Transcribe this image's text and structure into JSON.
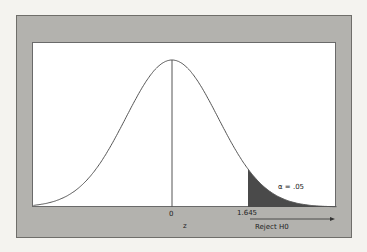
{
  "chart_data": {
    "type": "area",
    "title": "",
    "xlabel": "z",
    "ylabel": "",
    "x_ticks": [
      {
        "value": 0,
        "label": "0"
      },
      {
        "value": 1.645,
        "label": "1.645"
      }
    ],
    "curve": {
      "distribution": "normal",
      "mean": 0,
      "sd": 1,
      "x_range": [
        -3.0,
        3.56
      ]
    },
    "shaded_region": {
      "from": 1.645,
      "to": 3.56,
      "color": "#4a4a4a",
      "label": "α = .05"
    },
    "annotations": [
      {
        "text": "α = .05",
        "x": 2.3,
        "position": "inside tail"
      },
      {
        "text": "Reject H0",
        "type": "arrow",
        "direction": "right",
        "from": 1.645
      }
    ],
    "grid": false,
    "legend": null
  },
  "labels": {
    "zero": "0",
    "critical": "1.645",
    "axis": "z",
    "alpha": "α = .05",
    "reject": "Reject H0"
  },
  "colors": {
    "frame": "#b3b2ae",
    "panel": "#ffffff",
    "shade": "#4a4a4a",
    "curve": "#555555"
  }
}
